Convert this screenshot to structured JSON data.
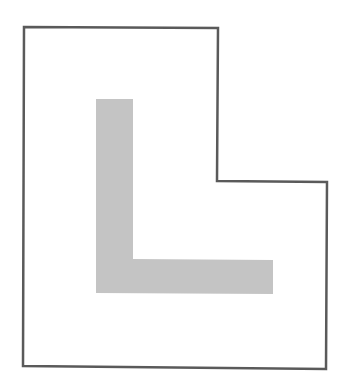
{
  "diagram": {
    "width": 344,
    "height": 387,
    "background": "#ffffff",
    "outline": {
      "points": "24,27 218,28 217,181 327,182 326,369 23,366",
      "stroke": "#5a5a5a",
      "stroke_width": 2.5,
      "fill": "#ffffff"
    },
    "letter_shape": {
      "glyph": "L",
      "points": "96,99 133,99 133,259 273,260 273,294 96,293",
      "fill": "#c4c4c4"
    }
  }
}
